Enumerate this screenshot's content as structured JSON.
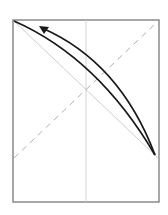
{
  "diagram": {
    "frame": {
      "x": 13,
      "y": 20,
      "width": 146,
      "height": 182,
      "stroke": "#8a8a8a"
    },
    "vertical_line": {
      "x": 86,
      "stroke": "#d4d4d4"
    },
    "diagonal_line": {
      "x1": 14,
      "y1": 21,
      "x2": 158,
      "y2": 158,
      "stroke": "#cfcfcf"
    },
    "dashed_line": {
      "x1": 14,
      "y1": 158,
      "x2": 154,
      "y2": 25,
      "stroke": "#b0b0b0",
      "dash": "6,5"
    },
    "curve_outer": {
      "path": "M14,21 Q98,58 155,155",
      "stroke": "#1a1a1a"
    },
    "curve_inner_arrow": {
      "path": "M155,155 Q120,62 42,28",
      "stroke": "#1a1a1a"
    },
    "arrowhead": {
      "points": "39,26 49,27 44,34",
      "fill": "#1a1a1a"
    }
  }
}
